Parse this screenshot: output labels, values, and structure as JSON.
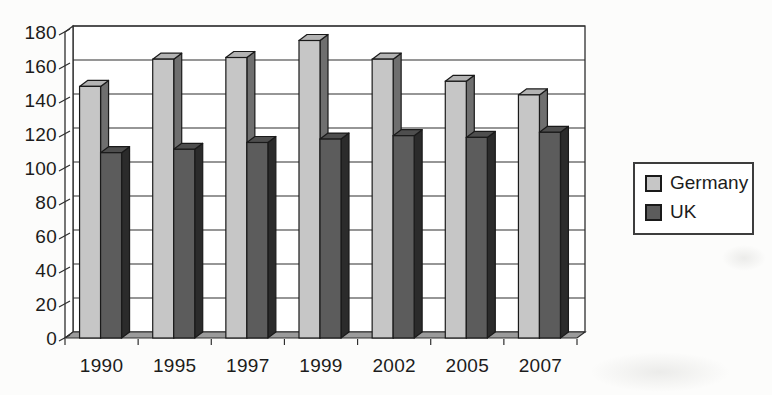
{
  "chart_data": {
    "type": "bar",
    "projection": "3d-column",
    "title": "",
    "xlabel": "",
    "ylabel": "",
    "categories": [
      "1990",
      "1995",
      "1997",
      "1999",
      "2002",
      "2005",
      "2007"
    ],
    "series": [
      {
        "name": "Germany",
        "values": [
          148,
          164,
          165,
          175,
          164,
          151,
          143
        ],
        "front_color": "#c6c6c6",
        "top_color": "#b3b3b3",
        "side_color": "#6f6f6f"
      },
      {
        "name": "UK",
        "values": [
          109,
          111,
          115,
          117,
          119,
          118,
          121
        ],
        "front_color": "#5c5c5c",
        "top_color": "#4e4e4e",
        "side_color": "#2b2b2b"
      }
    ],
    "ylim": [
      0,
      180
    ],
    "yticks": [
      0,
      20,
      40,
      60,
      80,
      100,
      120,
      140,
      160,
      180
    ],
    "grid": true,
    "legend_position": "right",
    "wall_color": "#ffffff",
    "floor_color": "#9b9b9b",
    "axis_color": "#2f2f2f",
    "bar_outline_color": "#1a1a1a",
    "text_color": "#1c1c1c"
  }
}
